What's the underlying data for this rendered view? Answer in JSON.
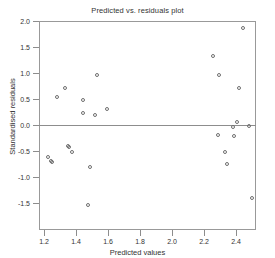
{
  "chart_data": {
    "type": "scatter",
    "title": "Predicted vs. residuals plot",
    "xlabel": "Predicted values",
    "ylabel": "Standardised residuals",
    "xlim": [
      1.145,
      2.5
    ],
    "ylim": [
      -1.62,
      2.0
    ],
    "xticks": [
      1.2,
      1.4,
      1.6,
      1.8,
      2.0,
      2.2,
      2.4
    ],
    "xtick_labels": [
      "1.2",
      "1.4",
      "1.6",
      "1.8",
      "2.0",
      "2.2",
      "2.4"
    ],
    "yticks": [
      2.0,
      1.5,
      1.0,
      0.5,
      0.0,
      -0.5,
      -1.0,
      -1.5
    ],
    "ytick_labels": [
      "2.0",
      "1.5",
      "1.0",
      "0.5",
      "0.0",
      "-0.5",
      "-1.0",
      "-1.5"
    ],
    "grid": false,
    "legend": null,
    "reference_line": {
      "orientation": "horizontal",
      "y": 0.0
    },
    "marker": {
      "shape": "open-circle",
      "color": "#6f6f6f",
      "size": 4
    },
    "points": [
      {
        "x": 1.225,
        "y": -0.62
      },
      {
        "x": 1.244,
        "y": -0.69
      },
      {
        "x": 1.25,
        "y": -0.71
      },
      {
        "x": 1.281,
        "y": 0.54
      },
      {
        "x": 1.331,
        "y": 0.71
      },
      {
        "x": 1.35,
        "y": -0.4
      },
      {
        "x": 1.356,
        "y": -0.42
      },
      {
        "x": 1.375,
        "y": -0.52
      },
      {
        "x": 1.444,
        "y": 0.48
      },
      {
        "x": 1.444,
        "y": 0.23
      },
      {
        "x": 1.475,
        "y": -1.54
      },
      {
        "x": 1.487,
        "y": -0.81
      },
      {
        "x": 1.531,
        "y": 0.96
      },
      {
        "x": 1.519,
        "y": 0.19
      },
      {
        "x": 1.594,
        "y": 0.31
      },
      {
        "x": 2.256,
        "y": 1.33
      },
      {
        "x": 2.294,
        "y": 0.96
      },
      {
        "x": 2.288,
        "y": -0.19
      },
      {
        "x": 2.331,
        "y": -0.52
      },
      {
        "x": 2.344,
        "y": -0.75
      },
      {
        "x": 2.381,
        "y": -0.04
      },
      {
        "x": 2.388,
        "y": -0.21
      },
      {
        "x": 2.406,
        "y": 0.06
      },
      {
        "x": 2.419,
        "y": 0.71
      },
      {
        "x": 2.444,
        "y": 1.86
      },
      {
        "x": 2.481,
        "y": -0.02
      },
      {
        "x": 2.5,
        "y": -1.4
      }
    ]
  }
}
